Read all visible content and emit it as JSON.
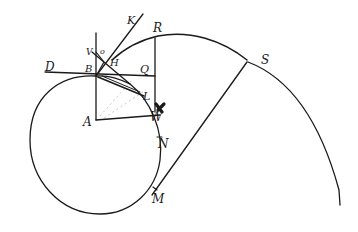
{
  "diagram": {
    "type": "hand-drawn geometric construction",
    "ink_color": "#1a1a1a",
    "background": "#ffffff",
    "labels": {
      "A": "A",
      "B": "B",
      "D": "D",
      "Q": "Q",
      "R": "R",
      "K": "K",
      "V": "V",
      "O": "o",
      "H": "H",
      "L": "L",
      "W": "W",
      "N": "N",
      "M": "M",
      "S": "S"
    },
    "points": {
      "A": [
        96,
        120
      ],
      "B": [
        96,
        74
      ],
      "L": [
        144,
        96
      ],
      "N": [
        157,
        140
      ],
      "M": [
        152,
        195
      ],
      "S": [
        247,
        62
      ],
      "R": [
        158,
        36
      ]
    },
    "elements": [
      "circle centered at A through B",
      "vertical line through A and B",
      "horizontal tangent line D-Q at B",
      "radius A-N horizontal",
      "vertical line from R down through Q",
      "tangent line through H toward K",
      "chord B-L",
      "large arc R-S continuing down right",
      "line S-M"
    ]
  }
}
